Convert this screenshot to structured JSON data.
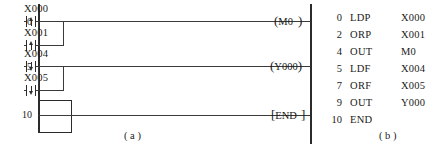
{
  "figure": {
    "kind": "plc-ladder-and-instruction-list",
    "captions": {
      "a": "( a )",
      "b": "( b )"
    }
  },
  "ladder": {
    "title": "Ladder diagram",
    "rungs": [
      {
        "step": "0",
        "branches": [
          {
            "device": "X000",
            "contact_type": "rising-pulse",
            "symbol": "-|↑|-"
          },
          {
            "device": "X001",
            "contact_type": "rising-pulse",
            "symbol": "-|↑|-"
          }
        ],
        "output": {
          "device": "M0",
          "open": "(",
          "close": ")",
          "text": "M0"
        }
      },
      {
        "step": "5",
        "branches": [
          {
            "device": "X004",
            "contact_type": "falling-pulse",
            "symbol": "-|↓|-"
          },
          {
            "device": "X005",
            "contact_type": "falling-pulse",
            "symbol": "-|↓|-"
          }
        ],
        "output": {
          "device": "Y000",
          "open": "(",
          "close": ")",
          "text": "Y000"
        }
      },
      {
        "step": "10",
        "branches": [],
        "output": {
          "device": "END",
          "open": "[",
          "close": "]",
          "text": "END"
        }
      }
    ]
  },
  "instruction_list": {
    "title": "Instruction list",
    "columns": [
      "step",
      "operation",
      "operand"
    ],
    "rows": [
      {
        "step": "0",
        "op": "LDP",
        "arg": "X000"
      },
      {
        "step": "2",
        "op": "ORP",
        "arg": "X001"
      },
      {
        "step": "4",
        "op": "OUT",
        "arg": "M0"
      },
      {
        "step": "5",
        "op": "LDF",
        "arg": "X004"
      },
      {
        "step": "7",
        "op": "ORF",
        "arg": "X005"
      },
      {
        "step": "9",
        "op": "OUT",
        "arg": "Y000"
      },
      {
        "step": "10",
        "op": "END",
        "arg": ""
      }
    ]
  },
  "colors": {
    "ink": "#1a1a1a",
    "line": "#2b2b2b",
    "wire": "#3a3a3a",
    "background": "#ffffff"
  }
}
